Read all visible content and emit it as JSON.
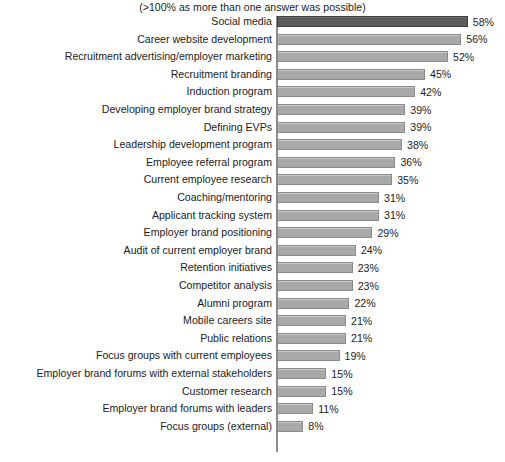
{
  "chart_data": {
    "type": "bar",
    "orientation": "horizontal",
    "title": "(>100% as more than one answer was possible)",
    "xlabel": "",
    "ylabel": "",
    "xlim": [
      0,
      58
    ],
    "grid": false,
    "legend": false,
    "value_suffix": "%",
    "highlight_index": 0,
    "colors": {
      "bar": "#a9a9a9",
      "bar_border": "#8a8a8a",
      "bar_highlight": "#5b5b5b",
      "bar_highlight_border": "#3f3f3f",
      "axis": "#8c8c8c",
      "text": "#1b1b1b",
      "background": "#ffffff"
    },
    "categories": [
      "Social media",
      "Career website development",
      "Recruitment advertising/employer marketing",
      "Recruitment branding",
      "Induction program",
      "Developing employer brand strategy",
      "Defining EVPs",
      "Leadership development program",
      "Employee referral program",
      "Current employee research",
      "Coaching/mentoring",
      "Applicant tracking system",
      "Employer brand positioning",
      "Audit of current employer brand",
      "Retention initiatives",
      "Competitor analysis",
      "Alumni program",
      "Mobile careers site",
      "Public relations",
      "Focus groups with current employees",
      "Employer brand forums with external stakeholders",
      "Customer research",
      "Employer brand forums with leaders",
      "Focus groups (external)"
    ],
    "values": [
      58,
      56,
      52,
      45,
      42,
      39,
      39,
      38,
      36,
      35,
      31,
      31,
      29,
      24,
      23,
      23,
      22,
      21,
      21,
      19,
      15,
      15,
      11,
      8
    ],
    "value_labels": [
      "58%",
      "56%",
      "52%",
      "45%",
      "42%",
      "39%",
      "39%",
      "38%",
      "36%",
      "35%",
      "31%",
      "31%",
      "29%",
      "24%",
      "23%",
      "23%",
      "22%",
      "21%",
      "21%",
      "19%",
      "15%",
      "15%",
      "11%",
      "8%"
    ]
  }
}
